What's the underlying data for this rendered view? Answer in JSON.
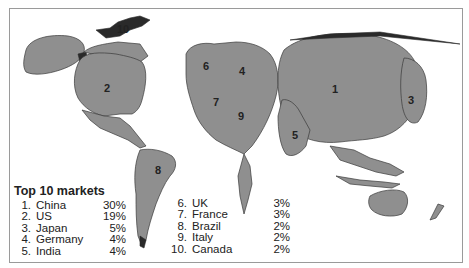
{
  "legend": {
    "title": "Top 10 markets",
    "items": [
      {
        "rank": "1.",
        "country": "China",
        "share": "30%"
      },
      {
        "rank": "2.",
        "country": "US",
        "share": "19%"
      },
      {
        "rank": "3.",
        "country": "Japan",
        "share": "5%"
      },
      {
        "rank": "4.",
        "country": "Germany",
        "share": "4%"
      },
      {
        "rank": "5.",
        "country": "India",
        "share": "4%"
      },
      {
        "rank": "6.",
        "country": "UK",
        "share": "3%"
      },
      {
        "rank": "7.",
        "country": "France",
        "share": "3%"
      },
      {
        "rank": "8.",
        "country": "Brazil",
        "share": "2%"
      },
      {
        "rank": "9.",
        "country": "Italy",
        "share": "2%"
      },
      {
        "rank": "10.",
        "country": "Canada",
        "share": "2%"
      }
    ]
  },
  "map_labels": {
    "china": "1",
    "us": "2",
    "japan": "3",
    "germany": "4",
    "india": "5",
    "uk": "6",
    "france": "7",
    "brazil": "8",
    "italy": "9",
    "canada": "10"
  },
  "colors": {
    "land": "#8f8f8f",
    "border": "#3a3a3a",
    "frame": "#9a9a9a"
  }
}
